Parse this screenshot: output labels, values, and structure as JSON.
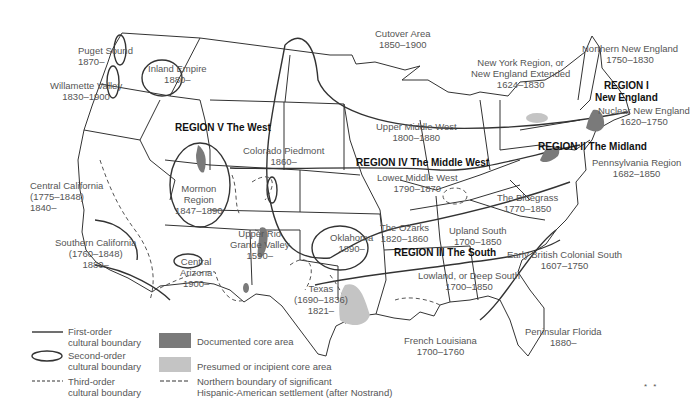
{
  "map": {
    "title": "Cultural regions of the United States",
    "regions": [
      {
        "id": "r1",
        "label_line1": "REGION I",
        "label_line2": "New England"
      },
      {
        "id": "r2",
        "label": "REGION II  The Midland"
      },
      {
        "id": "r3",
        "label": "REGION III The South"
      },
      {
        "id": "r4",
        "label": "REGION IV The Middle West"
      },
      {
        "id": "r5",
        "label": "REGION V  The West"
      }
    ],
    "areas": {
      "puget_sound": {
        "name": "Puget Sound",
        "dates": "1870–"
      },
      "inland_empire": {
        "name": "Inland Empire",
        "dates": "1880–"
      },
      "willamette_valley": {
        "name": "Willamette Valley",
        "dates": "1830–1900"
      },
      "cutover_area": {
        "name": "Cutover Area",
        "dates": "1850–1900"
      },
      "new_york_region": {
        "name1": "New York Region, or",
        "name2": "New England Extended",
        "dates": "1624–1830"
      },
      "northern_new_england": {
        "name": "Northern New England",
        "dates": "1750–1830"
      },
      "nuclear_new_england": {
        "name": "Nuclear New England",
        "dates": "1620–1750"
      },
      "upper_middle_west": {
        "name": "Upper Middle West",
        "dates": "1800–1880"
      },
      "colorado_piedmont": {
        "name": "Colorado Piedmont",
        "dates": "1860–"
      },
      "pennsylvania_region": {
        "name": "Pennsylvania Region",
        "dates": "1682–1850"
      },
      "lower_middle_west": {
        "name": "Lower Middle West",
        "dates": "1790–1870"
      },
      "central_california": {
        "name": "Central California",
        "dates1": "(1775–1848)",
        "dates2": "1840–"
      },
      "mormon_region": {
        "name1": "Mormon",
        "name2": "Region",
        "dates": "1847–1890"
      },
      "the_bluegrass": {
        "name": "The Bluegrass",
        "dates": "1770–1850"
      },
      "the_ozarks": {
        "name": "The Ozarks",
        "dates": "1820–1860"
      },
      "upland_south": {
        "name": "Upland South",
        "dates": "1700–1850"
      },
      "oklahoma": {
        "name": "Oklahoma",
        "dates": "1890–"
      },
      "upper_rio_grande": {
        "name1": "Upper Rio",
        "name2": "Grande Valley",
        "dates": "1590–"
      },
      "southern_california": {
        "name": "Southern California",
        "dates1": "(1760–1848)",
        "dates2": "1880–"
      },
      "central_arizona": {
        "name1": "Central",
        "name2": "Arizona",
        "dates": "1900–"
      },
      "early_british_colonial_south": {
        "name": "Early British Colonial South",
        "dates": "1607–1750"
      },
      "lowland_deep_south": {
        "name": "Lowland, or Deep South",
        "dates": "1700–1850"
      },
      "texas": {
        "name": "Texas",
        "dates1": "(1690–1836)",
        "dates2": "1821–"
      },
      "french_louisiana": {
        "name": "French Louisiana",
        "dates": "1700–1760"
      },
      "peninsular_florida": {
        "name": "Peninsular Florida",
        "dates": "1880–"
      }
    }
  },
  "legend": {
    "first_order": {
      "line1": "First-order",
      "line2": "cultural boundary"
    },
    "second_order": {
      "line1": "Second-order",
      "line2": "cultural boundary"
    },
    "third_order": {
      "line1": "Third-order",
      "line2": "cultural boundary"
    },
    "documented_core": {
      "label": "Documented core area",
      "color": "#7a7a7a"
    },
    "presumed_core": {
      "label": "Presumed or incipient core area",
      "color": "#c4c4c4"
    },
    "hispanic_boundary": {
      "line1": "Northern boundary of significant",
      "line2": "Hispanic-American settlement (after Nostrand)"
    }
  },
  "footer_mark": "* *"
}
